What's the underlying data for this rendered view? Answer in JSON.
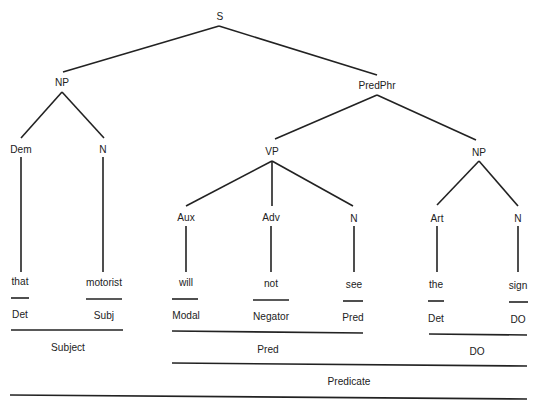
{
  "tree": {
    "root": "S",
    "nodes": {
      "s": "S",
      "np_subject": "NP",
      "predphr": "PredPhr",
      "dem": "Dem",
      "n_subject": "N",
      "vp": "VP",
      "np_object": "NP",
      "aux": "Aux",
      "adv": "Adv",
      "n_verb": "N",
      "art": "Art",
      "n_object": "N"
    },
    "words": [
      "that",
      "motorist",
      "will",
      "not",
      "see",
      "the",
      "sign"
    ],
    "functions": [
      "Det",
      "Subj",
      "Modal",
      "Negator",
      "Pred",
      "Det",
      "DO"
    ],
    "groups": {
      "subject": "Subject",
      "pred": "Pred",
      "do": "DO",
      "predicate": "Predicate"
    }
  }
}
